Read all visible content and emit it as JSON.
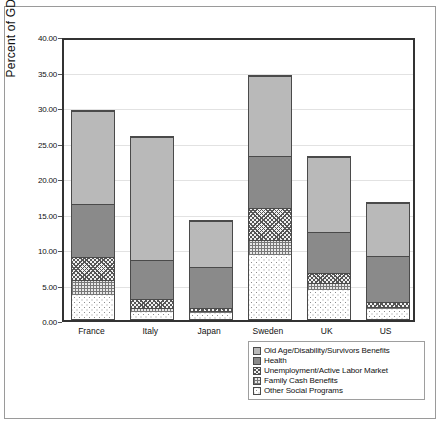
{
  "chart_data": {
    "type": "bar",
    "subtype": "stacked",
    "title": "",
    "xlabel": "",
    "ylabel": "Percent of GDP",
    "ylim": [
      0,
      40
    ],
    "ytick_step": 5,
    "ytick_labels": [
      "0.00",
      "5.00",
      "10.00",
      "15.00",
      "20.00",
      "25.00",
      "30.00",
      "35.00",
      "40.00"
    ],
    "ytick_values": [
      0,
      5,
      10,
      15,
      20,
      25,
      30,
      35,
      40
    ],
    "grid": true,
    "legend_position": "bottom-right",
    "categories": [
      "France",
      "Italy",
      "Japan",
      "Sweden",
      "UK",
      "US"
    ],
    "series": [
      {
        "name": "Other Social Programs",
        "pattern": "dots",
        "values": [
          3.4,
          1.0,
          0.8,
          9.1,
          4.1,
          1.5
        ]
      },
      {
        "name": "Family Cash Benefits",
        "pattern": "grid",
        "values": [
          2.2,
          0.5,
          0.3,
          2.1,
          1.0,
          0.2
        ]
      },
      {
        "name": "Unemployment/Active Labor Market",
        "pattern": "crosshatch",
        "values": [
          3.2,
          1.4,
          0.5,
          4.6,
          1.4,
          0.7
        ]
      },
      {
        "name": "Health",
        "pattern": "dark-gray",
        "values": [
          7.6,
          5.5,
          5.8,
          7.3,
          5.9,
          6.6
        ]
      },
      {
        "name": "Old Age/Disability/Survivors Benefits",
        "pattern": "light-gray",
        "values": [
          13.2,
          17.5,
          6.7,
          11.4,
          10.7,
          7.6
        ]
      }
    ],
    "totals": [
      29.6,
      25.9,
      14.1,
      34.5,
      23.1,
      16.6
    ]
  },
  "legend": {
    "items": [
      {
        "label": "Old Age/Disability/Survivors Benefits",
        "fill": "f-old"
      },
      {
        "label": "Health",
        "fill": "f-health"
      },
      {
        "label": "Unemployment/Active Labor Market",
        "fill": "f-unemp"
      },
      {
        "label": "Family Cash Benefits",
        "fill": "f-family"
      },
      {
        "label": "Other Social Programs",
        "fill": "f-other"
      }
    ]
  },
  "colors": {
    "old_age": "#b9b9b9",
    "health": "#8a8a8a",
    "axis": "#333333",
    "grid": "#e2e2e2",
    "border": "#4a4a4a"
  }
}
